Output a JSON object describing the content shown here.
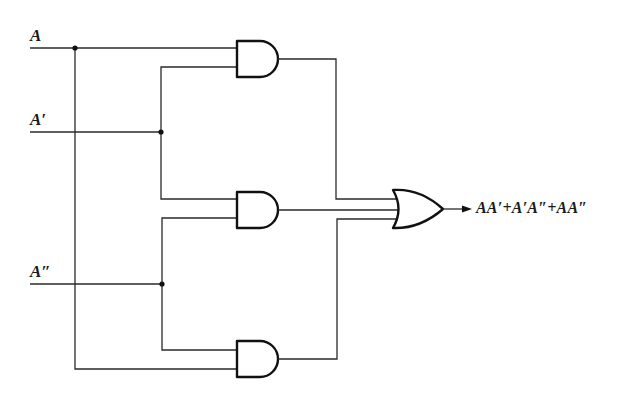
{
  "diagram": {
    "type": "logic-circuit",
    "inputs": [
      {
        "id": "A",
        "label": "A"
      },
      {
        "id": "A1",
        "label": "A′"
      },
      {
        "id": "A2",
        "label": "A″"
      }
    ],
    "gates": [
      {
        "id": "and1",
        "type": "AND",
        "inputs": [
          "A",
          "A′"
        ]
      },
      {
        "id": "and2",
        "type": "AND",
        "inputs": [
          "A′",
          "A″"
        ]
      },
      {
        "id": "and3",
        "type": "AND",
        "inputs": [
          "A″",
          "A"
        ]
      },
      {
        "id": "or1",
        "type": "OR",
        "inputs": [
          "and1",
          "and2",
          "and3"
        ]
      }
    ],
    "output": {
      "label": "AA′+A′A″+AA″"
    },
    "colors": {
      "wire": "#2a2a2a",
      "gate_stroke": "#111111",
      "background": "#ffffff"
    }
  }
}
